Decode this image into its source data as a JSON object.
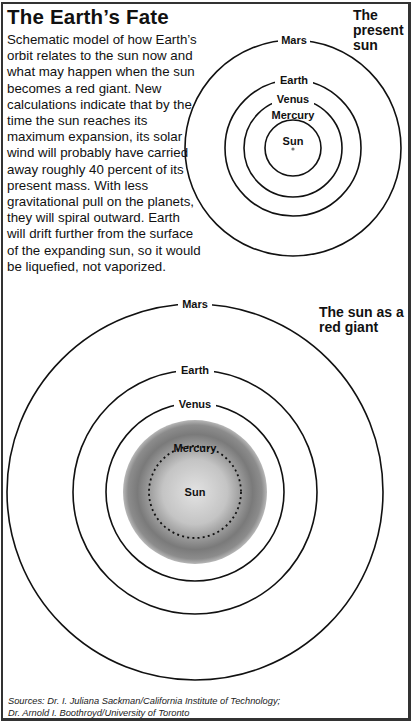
{
  "title": "The Earth’s Fate",
  "description": "Schematic model of how Earth’s orbit relates to the sun now and what may happen when the sun becomes a red giant. New calculations indicate that by the time the sun reaches its maximum expansion, its solar wind will probably have carried away roughly 40 percent of its present mass. With less gravitational pull on the planets, they will spiral outward. Earth will drift further from the surface of the expanding sun, so it would be liquefied, not vaporized.",
  "present_diagram": {
    "heading": "The present sun",
    "orbits": [
      {
        "name": "Mars",
        "label": "Mars"
      },
      {
        "name": "Earth",
        "label": "Earth"
      },
      {
        "name": "Venus",
        "label": "Venus"
      },
      {
        "name": "Mercury",
        "label": "Mercury"
      }
    ],
    "sun_label": "Sun"
  },
  "red_giant_diagram": {
    "heading": "The sun as a red giant",
    "orbits": [
      {
        "name": "Mars",
        "label": "Mars"
      },
      {
        "name": "Earth",
        "label": "Earth"
      },
      {
        "name": "Venus",
        "label": "Venus"
      },
      {
        "name": "Mercury",
        "label": "Mercury",
        "style": "dotted"
      }
    ],
    "sun_label": "Sun"
  },
  "sources": {
    "line1": "Sources: Dr. I. Juliana Sackman/California Institute of Technology;",
    "line2": "Dr. Arnold I. Boothroyd/University of Toronto"
  },
  "colors": {
    "ink": "#111111",
    "frame": "#333333",
    "sun_core": "#d8d8d8",
    "sun_edge": "#6e6e6e"
  }
}
